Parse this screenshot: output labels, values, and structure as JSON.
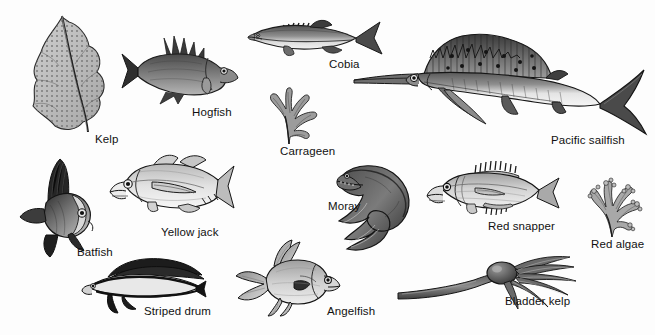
{
  "plate": {
    "title": "Marine organisms illustration plate",
    "background_color": "#fdfdfd",
    "ink_color": "#1a1a1a",
    "mid_tone": "#8d8d8d",
    "light_tone": "#d6d6d6",
    "style": "graphite pencil / ink scientific illustration, grayscale",
    "width": 655,
    "height": 335
  },
  "organisms": [
    {
      "id": "kelp",
      "label": "Kelp",
      "kind": "alga",
      "label_x": 95,
      "label_y": 133,
      "art_x": 25,
      "art_y": 14,
      "art_w": 95,
      "art_h": 118
    },
    {
      "id": "hogfish",
      "label": "Hogfish",
      "kind": "fish",
      "label_x": 192,
      "label_y": 106,
      "art_x": 120,
      "art_y": 34,
      "art_w": 120,
      "art_h": 70
    },
    {
      "id": "cobia",
      "label": "Cobia",
      "kind": "fish",
      "label_x": 329,
      "label_y": 58,
      "art_x": 248,
      "art_y": 16,
      "art_w": 135,
      "art_h": 45
    },
    {
      "id": "carrageen",
      "label": "Carrageen",
      "kind": "alga",
      "label_x": 280,
      "label_y": 145,
      "art_x": 253,
      "art_y": 86,
      "art_w": 75,
      "art_h": 60
    },
    {
      "id": "pacific-sailfish",
      "label": "Pacific sailfish",
      "kind": "fish",
      "label_x": 551,
      "label_y": 134,
      "art_x": 352,
      "art_y": 26,
      "art_w": 296,
      "art_h": 112
    },
    {
      "id": "batfish",
      "label": "Batfish",
      "kind": "fish",
      "label_x": 77,
      "label_y": 246,
      "art_x": 14,
      "art_y": 157,
      "art_w": 85,
      "art_h": 100
    },
    {
      "id": "yellow-jack",
      "label": "Yellow jack",
      "kind": "fish",
      "label_x": 161,
      "label_y": 226,
      "art_x": 108,
      "art_y": 152,
      "art_w": 125,
      "art_h": 72
    },
    {
      "id": "moray",
      "label": "Moray",
      "kind": "fish",
      "label_x": 328,
      "label_y": 200,
      "art_x": 335,
      "art_y": 161,
      "art_w": 105,
      "art_h": 100
    },
    {
      "id": "red-snapper",
      "label": "Red snapper",
      "kind": "fish",
      "label_x": 488,
      "label_y": 220,
      "art_x": 427,
      "art_y": 160,
      "art_w": 133,
      "art_h": 65
    },
    {
      "id": "red-algae",
      "label": "Red algae",
      "kind": "alga",
      "label_x": 591,
      "label_y": 238,
      "art_x": 578,
      "art_y": 177,
      "art_w": 70,
      "art_h": 62
    },
    {
      "id": "striped-drum",
      "label": "Striped drum",
      "kind": "fish",
      "label_x": 144,
      "label_y": 305,
      "art_x": 78,
      "art_y": 255,
      "art_w": 125,
      "art_h": 58
    },
    {
      "id": "angelfish",
      "label": "Angelfish",
      "kind": "fish",
      "label_x": 327,
      "label_y": 305,
      "art_x": 232,
      "art_y": 238,
      "art_w": 110,
      "art_h": 78
    },
    {
      "id": "bladder-kelp",
      "label": "Bladder kelp",
      "kind": "alga",
      "label_x": 505,
      "label_y": 295,
      "art_x": 400,
      "art_y": 253,
      "art_w": 190,
      "art_h": 55
    }
  ]
}
